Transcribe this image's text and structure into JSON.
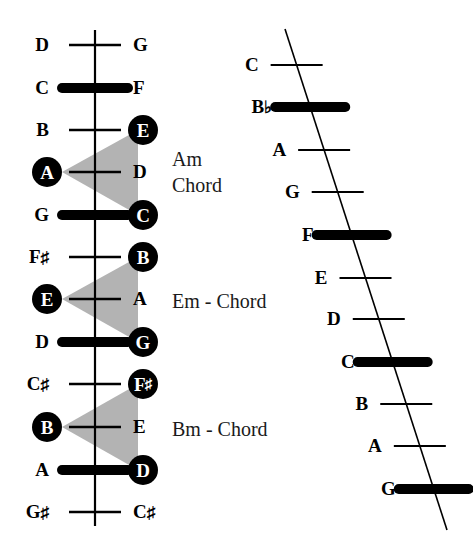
{
  "figure": {
    "colors": {
      "ink": "#000000",
      "shade": "#b3b3b3",
      "paper": "#ffffff"
    }
  },
  "left_staff": {
    "name": "vertical-staff",
    "axis": {
      "x": 95,
      "y_top": 30,
      "y_bottom": 526
    },
    "positions": [
      {
        "y": 45,
        "left": "D",
        "right": "G",
        "bar": false,
        "left_circled": false,
        "right_circled": false
      },
      {
        "y": 88,
        "left": "C",
        "right": "F",
        "bar": true,
        "left_circled": false,
        "right_circled": false
      },
      {
        "y": 130,
        "left": "B",
        "right": "E",
        "bar": false,
        "left_circled": false,
        "right_circled": true
      },
      {
        "y": 172,
        "left": "A",
        "right": "D",
        "bar": false,
        "left_circled": true,
        "right_circled": false
      },
      {
        "y": 215,
        "left": "G",
        "right": "C",
        "bar": true,
        "left_circled": false,
        "right_circled": true
      },
      {
        "y": 257,
        "left": "F#",
        "right": "B",
        "bar": false,
        "left_circled": false,
        "right_circled": true
      },
      {
        "y": 299,
        "left": "E",
        "right": "A",
        "bar": false,
        "left_circled": true,
        "right_circled": false
      },
      {
        "y": 342,
        "left": "D",
        "right": "G",
        "bar": true,
        "left_circled": false,
        "right_circled": true
      },
      {
        "y": 384,
        "left": "C#",
        "right": "F#",
        "bar": false,
        "left_circled": false,
        "right_circled": true
      },
      {
        "y": 427,
        "left": "B",
        "right": "E",
        "bar": false,
        "left_circled": true,
        "right_circled": false
      },
      {
        "y": 470,
        "left": "A",
        "right": "D",
        "bar": true,
        "left_circled": false,
        "right_circled": true
      },
      {
        "y": 512,
        "left": "G#",
        "right": "C#",
        "bar": false,
        "left_circled": false,
        "right_circled": false
      }
    ],
    "chords": [
      {
        "name": "Am Chord",
        "caption_lines": [
          "Am",
          "Chord"
        ],
        "caption_x": 172,
        "caption_y": 146,
        "apex_y": 172,
        "top_y": 130,
        "bottom_y": 215
      },
      {
        "name": "Em - Chord",
        "caption_lines": [
          "Em - Chord"
        ],
        "caption_x": 172,
        "caption_y": 288,
        "apex_y": 299,
        "top_y": 257,
        "bottom_y": 342
      },
      {
        "name": "Bm - Chord",
        "caption_lines": [
          "Bm - Chord"
        ],
        "caption_x": 172,
        "caption_y": 416,
        "apex_y": 427,
        "top_y": 384,
        "bottom_y": 470
      }
    ]
  },
  "right_staff": {
    "name": "slanted-staff",
    "axis": {
      "x_top": 285,
      "y_top": 29,
      "x_bottom": 447,
      "y_bottom": 530
    },
    "positions": [
      {
        "y": 65,
        "label": "C",
        "bar": false
      },
      {
        "y": 107,
        "label": "B",
        "accidental": "flat",
        "bar": true
      },
      {
        "y": 150,
        "label": "A",
        "bar": false
      },
      {
        "y": 192,
        "label": "G",
        "bar": false
      },
      {
        "y": 235,
        "label": "F",
        "bar": true
      },
      {
        "y": 278,
        "label": "E",
        "bar": false
      },
      {
        "y": 319,
        "label": "D",
        "bar": false
      },
      {
        "y": 362,
        "label": "C",
        "bar": true
      },
      {
        "y": 404,
        "label": "B",
        "bar": false
      },
      {
        "y": 446,
        "label": "A",
        "bar": false
      },
      {
        "y": 489,
        "label": "G",
        "bar": true
      }
    ]
  }
}
